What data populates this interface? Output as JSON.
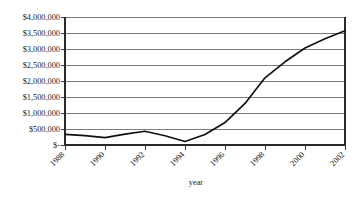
{
  "chart_data": {
    "type": "line",
    "title": "",
    "subtitle": "",
    "xlabel": "year",
    "ylabel": "",
    "grid": true,
    "legend": "none",
    "xlim": [
      1988,
      2002
    ],
    "ylim": [
      0,
      4000000
    ],
    "x_tick_labels": [
      "1988",
      "1990",
      "1992",
      "1994",
      "1996",
      "1998",
      "2000",
      "2002"
    ],
    "x_tick_values": [
      1988,
      1990,
      1992,
      1994,
      1996,
      1998,
      2000,
      2002
    ],
    "y_tick_labels": [
      "$-",
      "$500,000",
      "$1,000,000",
      "$1,500,000",
      "$2,000,000",
      "$2,500,000",
      "$3,000,000",
      "$3,500,000",
      "$4,000,000"
    ],
    "y_tick_values": [
      0,
      500000,
      1000000,
      1500000,
      2000000,
      2500000,
      3000000,
      3500000,
      4000000
    ],
    "series": [
      {
        "name": "value",
        "color": "#111111",
        "x": [
          1988,
          1989,
          1990,
          1991,
          1992,
          1993,
          1994,
          1995,
          1996,
          1997,
          1998,
          1999,
          2000,
          2001,
          2002
        ],
        "values": [
          330000,
          290000,
          230000,
          340000,
          430000,
          290000,
          110000,
          330000,
          700000,
          1300000,
          2100000,
          2600000,
          3030000,
          3320000,
          3570000
        ]
      }
    ]
  },
  "axis": {
    "x_title": "year"
  }
}
